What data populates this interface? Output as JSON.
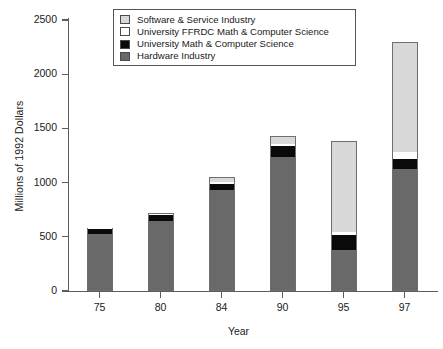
{
  "chart_data": {
    "type": "bar",
    "subtype": "stacked-vertical",
    "title": "",
    "xlabel": "Year",
    "ylabel": "Millions of 1992 Dollars",
    "categories": [
      "75",
      "80",
      "84",
      "90",
      "95",
      "97"
    ],
    "ylim": [
      0,
      2500
    ],
    "yticks": [
      0,
      500,
      1000,
      1500,
      2000,
      2500
    ],
    "ytick_labels": [
      "0",
      "500",
      "1000",
      "1500",
      "2000",
      "2500"
    ],
    "grid": false,
    "legend_position": "top-center-inside",
    "stack_order_bottom_to_top": [
      "Hardware Industry",
      "University Math & Computer Science",
      "University FFRDC Math & Computer Science",
      "Software & Service Industry"
    ],
    "series": [
      {
        "name": "Hardware Industry",
        "color": "#696969",
        "values": [
          525,
          645,
          930,
          1240,
          380,
          1125
        ]
      },
      {
        "name": "University Math & Computer Science",
        "color": "#0a0a0a",
        "values": [
          50,
          55,
          60,
          100,
          140,
          90
        ]
      },
      {
        "name": "University FFRDC Math & Computer Science",
        "color": "#ffffff",
        "values": [
          5,
          10,
          20,
          20,
          25,
          65
        ]
      },
      {
        "name": "Software & Service Industry",
        "color": "#d8d8d8",
        "values": [
          0,
          10,
          40,
          70,
          835,
          1020
        ]
      }
    ],
    "totals": [
      580,
      720,
      1050,
      1430,
      1380,
      2300
    ]
  },
  "axes": {
    "y_title": "Millions of 1992 Dollars",
    "x_title": "Year"
  },
  "legend": {
    "items": [
      {
        "label": "Software & Service Industry",
        "color": "#d8d8d8"
      },
      {
        "label": "University FFRDC Math & Computer Science",
        "color": "#ffffff"
      },
      {
        "label": "University Math & Computer Science",
        "color": "#0a0a0a"
      },
      {
        "label": "Hardware Industry",
        "color": "#696969"
      }
    ]
  }
}
